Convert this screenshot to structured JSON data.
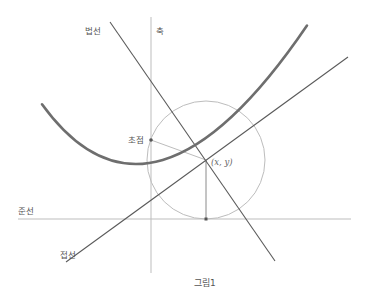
{
  "figure": {
    "caption": "그림1",
    "labels": {
      "normal": "법선",
      "axis": "축",
      "focus": "초점",
      "directrix": "준선",
      "tangent": "접선",
      "point": "(x, y)"
    },
    "colors": {
      "parabola": "#6e6e6e",
      "line_dark": "#5a5a5a",
      "line_light": "#bdbdbd",
      "circle": "#bdbdbd",
      "text": "#555555"
    }
  },
  "diagram": {
    "type": "parabola-reflection-property",
    "elements": [
      "parabola",
      "axis",
      "directrix",
      "focus",
      "point (x,y)",
      "tangent line",
      "normal line",
      "circle through focus centered at point"
    ]
  }
}
